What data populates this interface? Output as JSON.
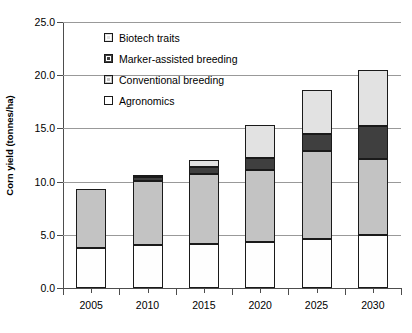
{
  "chart_data": {
    "type": "bar",
    "stacked": true,
    "title": "",
    "xlabel": "",
    "ylabel": "Corn yield (tonnes/ha)",
    "categories": [
      "2005",
      "2010",
      "2015",
      "2020",
      "2025",
      "2030"
    ],
    "ylim": [
      0.0,
      25.0
    ],
    "ytick_labels": [
      "0.0",
      "5.0",
      "10.0",
      "15.0",
      "20.0",
      "25.0"
    ],
    "ytick_values": [
      0.0,
      5.0,
      10.0,
      15.0,
      20.0,
      25.0
    ],
    "grid": "horizontal",
    "legend_position": "upper-left-inside",
    "legend_order": [
      "Biotech traits",
      "Marker-assisted breeding",
      "Conventional breeding",
      "Agronomics"
    ],
    "series": [
      {
        "name": "Agronomics",
        "color": "#fefefe",
        "values": [
          3.8,
          4.0,
          4.1,
          4.3,
          4.6,
          5.0
        ]
      },
      {
        "name": "Conventional breeding",
        "color": "#c3c3c3",
        "values": [
          5.5,
          6.1,
          6.6,
          6.8,
          8.3,
          7.1
        ]
      },
      {
        "name": "Marker-assisted breeding",
        "color": "#3f3f3f",
        "values": [
          0.0,
          0.3,
          0.7,
          1.1,
          1.6,
          3.1
        ]
      },
      {
        "name": "Biotech traits",
        "color": "#e2e2e2",
        "values": [
          0.0,
          0.2,
          0.6,
          3.1,
          4.1,
          5.3
        ]
      }
    ],
    "cumulative_tops": {
      "agronomics": [
        3.8,
        4.0,
        4.1,
        4.3,
        4.6,
        5.0
      ],
      "conventional": [
        9.3,
        10.1,
        10.7,
        11.1,
        12.9,
        12.1
      ],
      "marker": [
        9.3,
        10.4,
        11.4,
        12.2,
        14.5,
        15.2
      ],
      "biotech": [
        9.3,
        10.6,
        12.0,
        15.3,
        18.6,
        20.5
      ]
    },
    "totals": [
      9.3,
      10.6,
      12.0,
      15.3,
      18.6,
      20.5
    ]
  },
  "legend": {
    "items": [
      {
        "label": "Biotech traits",
        "swatch": "biotech"
      },
      {
        "label": "Marker-assisted breeding",
        "swatch": "marker"
      },
      {
        "label": "Conventional breeding",
        "swatch": "conventional"
      },
      {
        "label": "Agronomics",
        "swatch": "agronomics"
      }
    ]
  }
}
